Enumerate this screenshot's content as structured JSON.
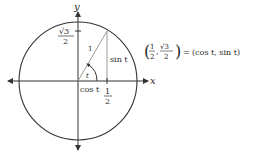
{
  "diagram": {
    "type": "unit-circle",
    "axes": {
      "x_label": "x",
      "y_label": "y"
    },
    "radius_label": "1",
    "angle_label": "t",
    "adjacent_label": "cos t",
    "opposite_label": "sin t",
    "x_tick": {
      "numerator": "1",
      "denominator": "2"
    },
    "y_tick": {
      "numerator": "√3",
      "denominator": "2"
    },
    "point": {
      "x_num": "1",
      "x_den": "2",
      "y_num": "√3",
      "y_den": "2",
      "equals": "=",
      "rhs": "(cos t, sin t)"
    },
    "colors": {
      "ink": "#2a2a2a",
      "circle": "#333333",
      "triangle": "#9a9a9a"
    }
  }
}
